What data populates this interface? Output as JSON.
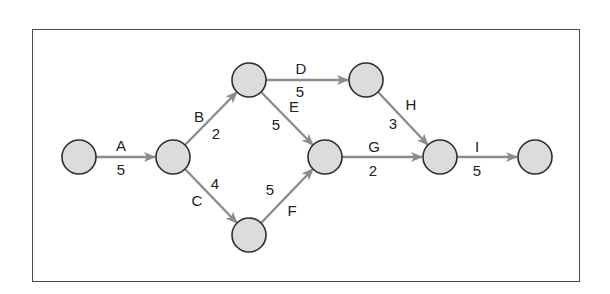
{
  "diagram": {
    "type": "activity-on-arrow network",
    "colors": {
      "node_fill": "#dcdcdc",
      "node_stroke": "#2e2e2e",
      "edge": "#8c8c8c",
      "text": "#222222",
      "frame": "#4a4a4a"
    },
    "nodes": [
      {
        "id": "n1",
        "x": 79,
        "y": 157
      },
      {
        "id": "n2",
        "x": 173,
        "y": 157
      },
      {
        "id": "n3",
        "x": 249,
        "y": 80
      },
      {
        "id": "n4",
        "x": 366,
        "y": 80
      },
      {
        "id": "n5",
        "x": 325,
        "y": 157
      },
      {
        "id": "n6",
        "x": 249,
        "y": 235
      },
      {
        "id": "n7",
        "x": 440,
        "y": 157
      },
      {
        "id": "n8",
        "x": 535,
        "y": 157
      }
    ],
    "activities": [
      {
        "label": "A",
        "duration": "5",
        "from": "n1",
        "to": "n2"
      },
      {
        "label": "B",
        "duration": "2",
        "from": "n2",
        "to": "n3"
      },
      {
        "label": "C",
        "duration": "4",
        "from": "n2",
        "to": "n6"
      },
      {
        "label": "D",
        "duration": "5",
        "from": "n3",
        "to": "n4"
      },
      {
        "label": "E",
        "duration": "5",
        "from": "n3",
        "to": "n5"
      },
      {
        "label": "F",
        "duration": "5",
        "from": "n6",
        "to": "n5"
      },
      {
        "label": "G",
        "duration": "2",
        "from": "n5",
        "to": "n7"
      },
      {
        "label": "H",
        "duration": "3",
        "from": "n4",
        "to": "n7"
      },
      {
        "label": "I",
        "duration": "5",
        "from": "n7",
        "to": "n8"
      }
    ]
  }
}
